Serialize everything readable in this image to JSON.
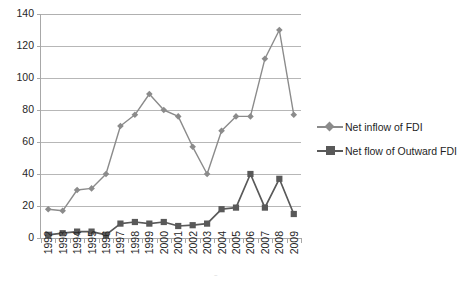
{
  "chart_data": {
    "type": "line",
    "title": "",
    "xlabel": "",
    "ylabel": "",
    "ylim": [
      0,
      140
    ],
    "ytick_step": 20,
    "yticks": [
      0,
      20,
      40,
      60,
      80,
      100,
      120,
      140
    ],
    "ytick_labels": [
      "0",
      "20",
      "40",
      "60",
      "80",
      "100",
      "120",
      "140"
    ],
    "grid": "horizontal",
    "legend_position": "right",
    "categories": [
      "1992",
      "1993",
      "1994",
      "1995",
      "1996",
      "1997",
      "1998",
      "1999",
      "2000",
      "2001",
      "2002",
      "2003",
      "2004",
      "2005",
      "2006",
      "2007",
      "2008",
      "2009"
    ],
    "series": [
      {
        "name": "Net inflow of FDI",
        "marker": "diamond",
        "color": "#8b8b8b",
        "values": [
          18,
          17,
          30,
          31,
          40,
          70,
          77,
          90,
          80,
          76,
          57,
          40,
          67,
          76,
          76,
          112,
          130,
          77
        ]
      },
      {
        "name": "Net flow of Outward FDI",
        "marker": "square",
        "color": "#595959",
        "values": [
          2,
          3,
          4,
          4,
          2,
          9,
          10,
          9,
          10,
          7.5,
          8,
          9,
          18,
          19,
          40,
          19,
          37,
          15
        ]
      }
    ]
  },
  "legend": {
    "items": [
      {
        "label": "Net inflow of FDI",
        "color": "#8b8b8b",
        "marker": "diamond"
      },
      {
        "label": "Net flow of Outward FDI",
        "color": "#595959",
        "marker": "square"
      }
    ]
  },
  "colors": {
    "inflow": "#8b8b8b",
    "outward": "#595959",
    "grid": "#b7b7b7",
    "axis": "#a8a8a8",
    "text": "#262626",
    "background": "#ffffff"
  }
}
